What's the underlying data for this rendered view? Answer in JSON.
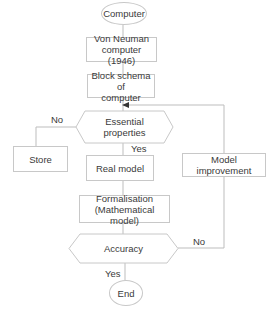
{
  "diagram": {
    "type": "flowchart",
    "nodes": {
      "start": "Computer",
      "von_neuman": "Von Neuman computer (1946)",
      "block_schema": "Block schema of computer",
      "essential": "Essential properties",
      "store": "Store",
      "real_model": "Real model",
      "model_improvement": "Model improvement",
      "formalisation": "Formalisation (Mathematical model)",
      "accuracy": "Accuracy",
      "end": "End"
    },
    "node_lines": {
      "von_neuman_1": "Von Neuman",
      "von_neuman_2": "computer (1946)",
      "block_schema_1": "Block schema of",
      "block_schema_2": "computer",
      "essential_1": "Essential",
      "essential_2": "properties",
      "formalisation_1": "Formalisation",
      "formalisation_2": "(Mathematical model)"
    },
    "edge_labels": {
      "essential_no": "No",
      "essential_yes": "Yes",
      "accuracy_no": "No",
      "accuracy_yes": "Yes"
    },
    "edges": [
      {
        "from": "Computer",
        "to": "Von Neuman computer (1946)"
      },
      {
        "from": "Von Neuman computer (1946)",
        "to": "Block schema of computer"
      },
      {
        "from": "Block schema of computer",
        "to": "Essential properties"
      },
      {
        "from": "Essential properties",
        "to": "Store",
        "label": "No"
      },
      {
        "from": "Essential properties",
        "to": "Real model",
        "label": "Yes"
      },
      {
        "from": "Real model",
        "to": "Formalisation (Mathematical model)"
      },
      {
        "from": "Formalisation (Mathematical model)",
        "to": "Accuracy"
      },
      {
        "from": "Accuracy",
        "to": "Model improvement",
        "label": "No"
      },
      {
        "from": "Model improvement",
        "to": "Essential properties"
      },
      {
        "from": "Accuracy",
        "to": "End",
        "label": "Yes"
      }
    ],
    "colors": {
      "stroke": "#c8c8c8",
      "text": "#3a3a3a",
      "background": "#ffffff"
    }
  }
}
